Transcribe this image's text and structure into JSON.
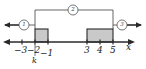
{
  "figure": {
    "axis": {
      "name": "x",
      "left_arrow": "arrow-left",
      "right_arrow": "arrow-right",
      "ticks": [
        {
          "label": "−3",
          "value": -3,
          "px": 22
        },
        {
          "label": "−2",
          "value": -2,
          "px": 35
        },
        {
          "label": "−1",
          "value": -1,
          "px": 48
        },
        {
          "label": "3",
          "value": 3,
          "px": 87
        },
        {
          "label": "4",
          "value": 4,
          "px": 100
        },
        {
          "label": "5",
          "value": 5,
          "px": 113
        }
      ]
    },
    "pointer_label": {
      "text": "k",
      "points_to": -2
    },
    "pulses": [
      {
        "name": "left-pulse",
        "x_start": -2,
        "x_end": -1,
        "height": 1,
        "fill": "#c9c9c9"
      },
      {
        "name": "right-pulse",
        "x_start": 3,
        "x_end": 5,
        "height": 1,
        "fill": "#c9c9c9"
      }
    ],
    "callouts": [
      {
        "name": "callout-left",
        "text": "1",
        "cx": 24,
        "cy": 25
      },
      {
        "name": "callout-top",
        "text": "2",
        "cx": 73,
        "cy": 10
      },
      {
        "name": "callout-right",
        "text": "3",
        "cx": 122,
        "cy": 25
      }
    ],
    "colors": {
      "line": "#1a1a1a",
      "fill": "#c9c9c9",
      "leader": "#555555",
      "background": "#ffffff"
    }
  }
}
